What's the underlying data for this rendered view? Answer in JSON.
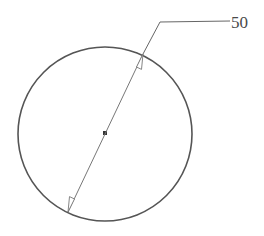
{
  "diagram": {
    "type": "diameter-dimension",
    "circle": {
      "cx": 105,
      "cy": 134,
      "r": 87,
      "stroke": "#555555"
    },
    "center_mark": {
      "x": 105,
      "y": 133,
      "color": "#333333"
    },
    "dimension_line": {
      "start": {
        "x": 68,
        "y": 212
      },
      "end": {
        "x": 143,
        "y": 54
      },
      "stroke": "#777777"
    },
    "leader": {
      "elbow": {
        "x": 160,
        "y": 22
      },
      "end": {
        "x": 230,
        "y": 21
      }
    },
    "label": {
      "text": "50",
      "x": 231,
      "y": 28
    }
  }
}
